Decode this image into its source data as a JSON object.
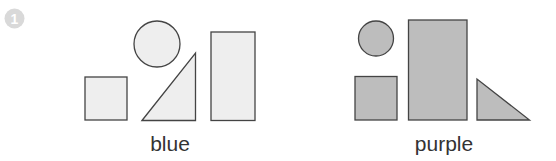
{
  "badge": {
    "number": "1",
    "color": "#d9d9d9"
  },
  "groups": [
    {
      "label": "blue",
      "fill": "#eeeeee",
      "shapes": [
        "square",
        "circle",
        "right-triangle",
        "tall-rectangle"
      ]
    },
    {
      "label": "purple",
      "fill": "#bdbdbd",
      "shapes": [
        "circle",
        "square",
        "tall-rectangle",
        "right-triangle"
      ]
    }
  ],
  "stroke_color": "#444444"
}
